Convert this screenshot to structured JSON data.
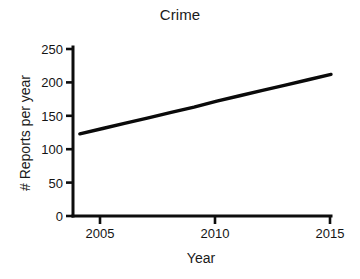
{
  "chart_data": {
    "type": "line",
    "title": "Crime",
    "xlabel": "Year",
    "ylabel": "# Reports per year",
    "x": [
      2004,
      2005,
      2006,
      2007,
      2008,
      2009,
      2010,
      2011,
      2012,
      2013,
      2014,
      2015
    ],
    "series": [
      {
        "name": "Reports",
        "values": [
          123,
          131,
          139,
          147,
          155,
          163,
          172,
          180,
          188,
          196,
          204,
          212
        ]
      }
    ],
    "xlim": [
      2003.7,
      2015
    ],
    "ylim": [
      0,
      250
    ],
    "xticks": [
      2005,
      2010,
      2015
    ],
    "xticklabels": [
      "2005",
      "2010",
      "2015"
    ],
    "yticks": [
      0,
      50,
      100,
      150,
      200,
      250
    ],
    "yticklabels": [
      "0",
      "50",
      "100",
      "150",
      "200",
      "250"
    ],
    "grid": false,
    "legend": false,
    "legend_position": "none",
    "line_color": "#0a0a0a",
    "background_color": "#ffffff",
    "axis_color": "#0d0d0d",
    "tick_direction": "out",
    "spines": [
      "left",
      "bottom"
    ]
  }
}
